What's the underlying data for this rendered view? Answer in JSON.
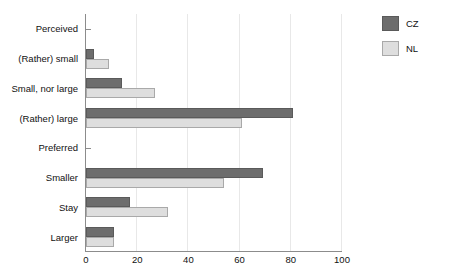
{
  "chart_data": {
    "type": "bar",
    "orientation": "horizontal",
    "title": "",
    "xlabel": "",
    "ylabel": "",
    "xlim": [
      0,
      100
    ],
    "xticks": [
      0,
      20,
      40,
      60,
      80,
      100
    ],
    "xtick_labels": [
      "0",
      "20",
      "40",
      "60",
      "80",
      "100"
    ],
    "grid": "vertical",
    "legend_position": "top-right",
    "legend": [
      {
        "name": "CZ",
        "color": "#6d6d6d"
      },
      {
        "name": "NL",
        "color": "#dedede"
      }
    ],
    "categories": [
      "Perceived",
      "(Rather) small",
      "Small, nor large",
      "(Rather) large",
      "Preferred",
      "Smaller",
      "Stay",
      "Larger"
    ],
    "group_headers": [
      "Perceived",
      "Preferred"
    ],
    "series": [
      {
        "name": "CZ",
        "color": "#6d6d6d",
        "values": [
          null,
          3,
          14,
          81,
          null,
          69,
          17,
          11
        ]
      },
      {
        "name": "NL",
        "color": "#dedede",
        "values": [
          null,
          9,
          27,
          61,
          null,
          54,
          32,
          11
        ]
      }
    ],
    "rows": [
      {
        "label": "Perceived",
        "header": true,
        "cz": null,
        "nl": null
      },
      {
        "label": "(Rather) small",
        "header": false,
        "cz": 3,
        "nl": 9
      },
      {
        "label": "Small, nor large",
        "header": false,
        "cz": 14,
        "nl": 27
      },
      {
        "label": "(Rather) large",
        "header": false,
        "cz": 81,
        "nl": 61
      },
      {
        "label": "Preferred",
        "header": true,
        "cz": null,
        "nl": null
      },
      {
        "label": "Smaller",
        "header": false,
        "cz": 69,
        "nl": 54
      },
      {
        "label": "Stay",
        "header": false,
        "cz": 17,
        "nl": 32
      },
      {
        "label": "Larger",
        "header": false,
        "cz": 11,
        "nl": 11
      }
    ]
  },
  "colors": {
    "cz": "#6d6d6d",
    "nl": "#dedede",
    "axis": "#8c8c8c",
    "grid": "#e8e8e8",
    "text": "#111111",
    "background": "#ffffff"
  }
}
